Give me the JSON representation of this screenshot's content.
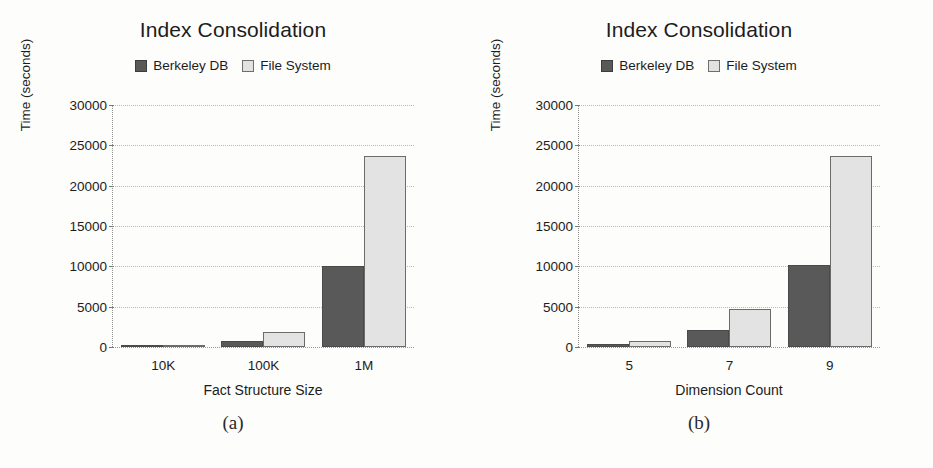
{
  "figures": [
    {
      "id": "figure-a",
      "caption": "(a)",
      "title": "Index Consolidation",
      "legend": [
        {
          "label": "Berkeley DB",
          "swatch": "dark-square-icon",
          "color": "#595959"
        },
        {
          "label": "File System",
          "swatch": "light-square-icon",
          "color": "#e3e3e3"
        }
      ],
      "chart_data": {
        "type": "bar",
        "title": "Index Consolidation",
        "xlabel": "Fact Structure Size",
        "ylabel": "Time (seconds)",
        "categories": [
          "10K",
          "100K",
          "1M"
        ],
        "series": [
          {
            "name": "Berkeley DB",
            "values": [
              60,
              800,
              10050
            ]
          },
          {
            "name": "File System",
            "values": [
              60,
              1900,
              23700
            ]
          }
        ],
        "ylim": [
          0,
          30000
        ],
        "yticks": [
          0,
          5000,
          10000,
          15000,
          20000,
          25000,
          30000
        ],
        "ytick_labels": [
          "0",
          "5000",
          "10000",
          "15000",
          "20000",
          "25000",
          "30000"
        ],
        "grid": true,
        "legend_position": "top-center"
      }
    },
    {
      "id": "figure-b",
      "caption": "(b)",
      "title": "Index Consolidation",
      "legend": [
        {
          "label": "Berkeley DB",
          "swatch": "dark-square-icon",
          "color": "#595959"
        },
        {
          "label": "File System",
          "swatch": "light-square-icon",
          "color": "#e3e3e3"
        }
      ],
      "chart_data": {
        "type": "bar",
        "title": "Index Consolidation",
        "xlabel": "Dimension Count",
        "ylabel": "Time (seconds)",
        "categories": [
          "5",
          "7",
          "9"
        ],
        "series": [
          {
            "name": "Berkeley DB",
            "values": [
              400,
              2100,
              10200
            ]
          },
          {
            "name": "File System",
            "values": [
              800,
              4700,
              23700
            ]
          }
        ],
        "ylim": [
          0,
          30000
        ],
        "yticks": [
          0,
          5000,
          10000,
          15000,
          20000,
          25000,
          30000
        ],
        "ytick_labels": [
          "0",
          "5000",
          "10000",
          "15000",
          "20000",
          "25000",
          "30000"
        ],
        "grid": true,
        "legend_position": "top-center"
      }
    }
  ]
}
